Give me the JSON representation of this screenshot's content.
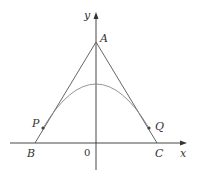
{
  "diagram": {
    "type": "geometry-plot",
    "axes": {
      "x_label": "x",
      "y_label": "y",
      "origin_label": "0"
    },
    "points": {
      "A": {
        "label": "A"
      },
      "B": {
        "label": "B"
      },
      "C": {
        "label": "C"
      },
      "P": {
        "label": "P"
      },
      "Q": {
        "label": "Q"
      }
    },
    "elements": [
      "x-axis with arrow",
      "y-axis with arrow",
      "line segment AB",
      "line segment AC",
      "downward parabola tangent to AB at P and AC at Q"
    ],
    "colors": {
      "axis": "#333333",
      "lines": "#555555",
      "curve": "#888888"
    }
  }
}
